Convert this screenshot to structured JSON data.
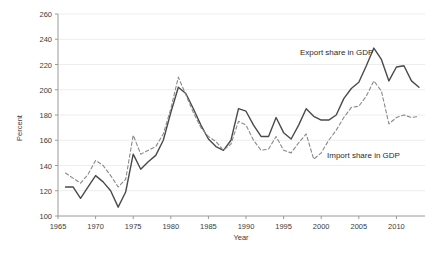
{
  "chart_data": {
    "type": "line",
    "title": "",
    "xlabel": "Year",
    "ylabel": "Percent",
    "xlim": [
      1965,
      2013.8
    ],
    "ylim": [
      100,
      260
    ],
    "xticks": [
      1965,
      1970,
      1975,
      1980,
      1985,
      1990,
      1995,
      2000,
      2005,
      2010
    ],
    "yticks": [
      100,
      120,
      140,
      160,
      180,
      200,
      220,
      240,
      260
    ],
    "grid": "horizontal",
    "legend_position": "inline-annotations",
    "annotations": [
      {
        "text": "Export share in GDP",
        "x": 2000.5,
        "y": 228
      },
      {
        "text": "Import share in GDP",
        "x": 2003.5,
        "y": 148
      }
    ],
    "series": [
      {
        "name": "Export share in GDP",
        "style": "solid",
        "color": "#4a4a4a",
        "x": [
          1966,
          1967,
          1968,
          1969,
          1970,
          1971,
          1972,
          1973,
          1974,
          1975,
          1976,
          1977,
          1978,
          1979,
          1980,
          1981,
          1982,
          1983,
          1984,
          1985,
          1986,
          1987,
          1988,
          1989,
          1990,
          1991,
          1992,
          1993,
          1994,
          1995,
          1996,
          1997,
          1998,
          1999,
          2000,
          2001,
          2002,
          2003,
          2004,
          2005,
          2006,
          2007,
          2008,
          2009,
          2010,
          2011,
          2012,
          2013
        ],
        "values": [
          123,
          123,
          114,
          123,
          132,
          127,
          120,
          107,
          119,
          149,
          137,
          143,
          148,
          160,
          182,
          202,
          197,
          185,
          172,
          161,
          155,
          152,
          160,
          185,
          183,
          172,
          163,
          163,
          178,
          166,
          161,
          172,
          185,
          179,
          176,
          176,
          180,
          193,
          201,
          206,
          219,
          233,
          224,
          207,
          218,
          219,
          207,
          202
        ]
      },
      {
        "name": "Import share in GDP",
        "style": "dashed",
        "color": "#8a8a8a",
        "x": [
          1966,
          1967,
          1968,
          1969,
          1970,
          1971,
          1972,
          1973,
          1974,
          1975,
          1976,
          1977,
          1978,
          1979,
          1980,
          1981,
          1982,
          1983,
          1984,
          1985,
          1986,
          1987,
          1988,
          1989,
          1990,
          1991,
          1992,
          1993,
          1994,
          1995,
          1996,
          1997,
          1998,
          1999,
          2000,
          2001,
          2002,
          2003,
          2004,
          2005,
          2006,
          2007,
          2008,
          2009,
          2010,
          2011,
          2012,
          2013
        ],
        "values": [
          134,
          130,
          126,
          133,
          144,
          140,
          132,
          123,
          129,
          164,
          149,
          152,
          155,
          165,
          185,
          210,
          196,
          182,
          170,
          163,
          159,
          152,
          157,
          175,
          172,
          160,
          152,
          153,
          163,
          152,
          150,
          158,
          165,
          145,
          150,
          160,
          168,
          178,
          186,
          187,
          195,
          207,
          199,
          173,
          178,
          180,
          178,
          179
        ]
      }
    ]
  },
  "axis": {
    "y_title": "Percent",
    "x_title": "Year",
    "y_tick_labels": [
      "100",
      "120",
      "140",
      "160",
      "180",
      "200",
      "220",
      "240",
      "260"
    ],
    "x_tick_labels": [
      "1965",
      "1970",
      "1975",
      "1980",
      "1985",
      "1990",
      "1995",
      "2000",
      "2005",
      "2010"
    ]
  },
  "labels": {
    "export_label": "Export share in GDP",
    "import_label": "Import share in GDP"
  },
  "colors": {
    "export_line": "#4a4a4a",
    "import_line": "#8a8a8a",
    "grid": "#ededed",
    "axis": "#9a9a9a",
    "text": "#3b3b3b"
  }
}
